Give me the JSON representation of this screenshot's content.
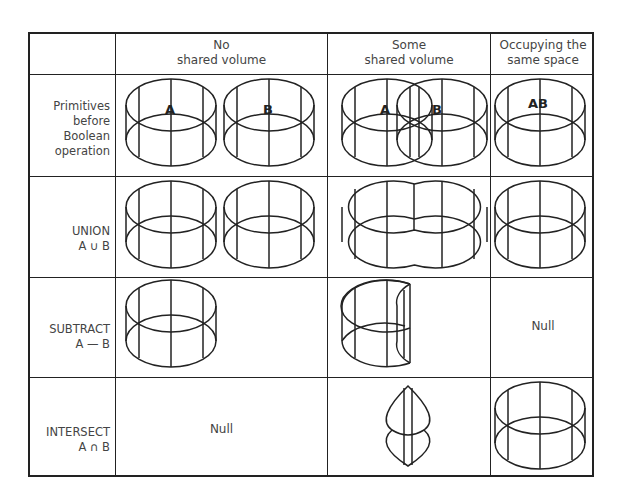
{
  "diagram": {
    "columns": [
      {
        "id": "row-header",
        "label": ""
      },
      {
        "id": "no-shared",
        "line1": "No",
        "line2": "shared volume"
      },
      {
        "id": "some-shared",
        "line1": "Some",
        "line2": "shared volume"
      },
      {
        "id": "same-space",
        "line1": "Occupying the",
        "line2": "same space"
      }
    ],
    "rows": [
      {
        "id": "primitives",
        "lines": [
          "Primitives",
          "before",
          "Boolean",
          "operation"
        ]
      },
      {
        "id": "union",
        "lines": [
          "UNION",
          "A ∪ B"
        ]
      },
      {
        "id": "subtract",
        "lines": [
          "SUBTRACT",
          "A — B"
        ]
      },
      {
        "id": "intersect",
        "lines": [
          "INTERSECT",
          "A ∩ B"
        ]
      }
    ],
    "labels": {
      "a": "A",
      "b": "B",
      "ab": "AB"
    },
    "null_text": "Null",
    "cells": {
      "primitives": {
        "no-shared": "two separate cylinders A and B",
        "some-shared": "two overlapping cylinders A and B",
        "same-space": "coincident cylinders AB"
      },
      "union": {
        "no-shared": "two separate cylinders",
        "some-shared": "merged double-lobed cylinder",
        "same-space": "single cylinder"
      },
      "subtract": {
        "no-shared": "cylinder A",
        "some-shared": "cylinder A with B's volume removed",
        "same-space": "Null"
      },
      "intersect": {
        "no-shared": "Null",
        "some-shared": "lens-shaped sliver",
        "same-space": "single cylinder"
      }
    }
  }
}
